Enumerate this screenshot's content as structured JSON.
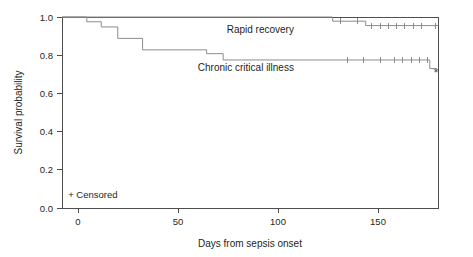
{
  "chart_data": {
    "type": "line",
    "subtype": "kaplan-meier-survival",
    "title": "",
    "xlabel": "Days from sepsis onset",
    "ylabel": "Survival probability",
    "xlim": [
      0,
      182
    ],
    "ylim": [
      0.0,
      1.0
    ],
    "xticks": [
      0,
      50,
      100,
      150
    ],
    "xtick_labels": [
      "0",
      "50",
      "100",
      "150"
    ],
    "yticks": [
      0.0,
      0.2,
      0.4,
      0.6,
      0.8,
      1.0
    ],
    "ytick_labels": [
      "0.0",
      "0.2",
      "0.4",
      "0.6",
      "0.8",
      "1.0"
    ],
    "grid": false,
    "legend_position": "inline-annotation",
    "annotations": [
      {
        "name": "censored-note",
        "text": "+ Censored",
        "x": 3,
        "y": 0.05
      }
    ],
    "series": [
      {
        "name": "Rapid recovery",
        "label": "Rapid recovery",
        "color": "#8c8c8c",
        "label_x": 96,
        "label_y": 0.915,
        "steps": [
          {
            "x": 0,
            "y": 1.0
          },
          {
            "x": 131,
            "y": 1.0
          },
          {
            "x": 131,
            "y": 0.978
          },
          {
            "x": 147,
            "y": 0.978
          },
          {
            "x": 147,
            "y": 0.955
          },
          {
            "x": 182,
            "y": 0.955
          }
        ],
        "censored": [
          {
            "x": 135,
            "y": 0.978
          },
          {
            "x": 143,
            "y": 0.978
          },
          {
            "x": 150,
            "y": 0.955
          },
          {
            "x": 154,
            "y": 0.955
          },
          {
            "x": 158,
            "y": 0.955
          },
          {
            "x": 162,
            "y": 0.955
          },
          {
            "x": 166,
            "y": 0.955
          },
          {
            "x": 170,
            "y": 0.955
          },
          {
            "x": 174,
            "y": 0.955
          },
          {
            "x": 181,
            "y": 0.955
          }
        ]
      },
      {
        "name": "Chronic critical illness",
        "label": "Chronic critical illness",
        "color": "#8c8c8c",
        "label_x": 89,
        "label_y": 0.715,
        "steps": [
          {
            "x": 0,
            "y": 1.0
          },
          {
            "x": 12,
            "y": 1.0
          },
          {
            "x": 12,
            "y": 0.975
          },
          {
            "x": 19,
            "y": 0.975
          },
          {
            "x": 19,
            "y": 0.948
          },
          {
            "x": 27,
            "y": 0.948
          },
          {
            "x": 27,
            "y": 0.888
          },
          {
            "x": 39,
            "y": 0.888
          },
          {
            "x": 39,
            "y": 0.828
          },
          {
            "x": 70,
            "y": 0.828
          },
          {
            "x": 70,
            "y": 0.808
          },
          {
            "x": 78,
            "y": 0.808
          },
          {
            "x": 78,
            "y": 0.775
          },
          {
            "x": 178,
            "y": 0.775
          },
          {
            "x": 178,
            "y": 0.73
          },
          {
            "x": 181,
            "y": 0.73
          }
        ],
        "censored": [
          {
            "x": 138,
            "y": 0.775
          },
          {
            "x": 146,
            "y": 0.775
          },
          {
            "x": 154,
            "y": 0.775
          },
          {
            "x": 161,
            "y": 0.775
          },
          {
            "x": 165,
            "y": 0.775
          },
          {
            "x": 169,
            "y": 0.775
          },
          {
            "x": 173,
            "y": 0.775
          },
          {
            "x": 177,
            "y": 0.775
          }
        ],
        "endpoint_marker": {
          "x": 181,
          "y": 0.685,
          "symbol": "*"
        }
      }
    ]
  }
}
